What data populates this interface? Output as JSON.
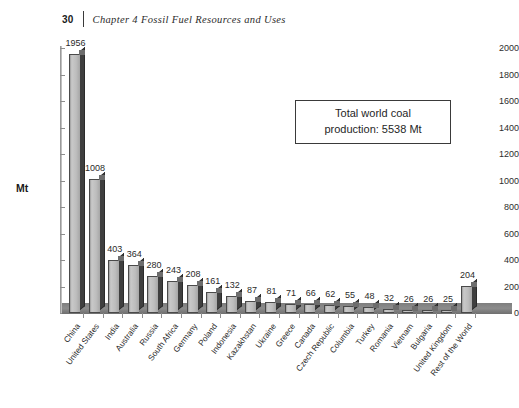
{
  "header": {
    "page_number": "30",
    "title": "Chapter 4  Fossil Fuel Resources and Uses"
  },
  "callout": {
    "line1": "Total world coal",
    "line2": "production: 5538 Mt"
  },
  "chart_data": {
    "type": "bar",
    "title": "",
    "xlabel": "",
    "ylabel": "Mt",
    "ylim": [
      0,
      2000
    ],
    "yticks": [
      0,
      200,
      400,
      600,
      800,
      1000,
      1200,
      1400,
      1600,
      1800,
      2000
    ],
    "grid": false,
    "legend": "none",
    "categories": [
      "China",
      "United States",
      "India",
      "Australia",
      "Russia",
      "South Africa",
      "Germany",
      "Poland",
      "Indonesia",
      "Kazakhstan",
      "Ukraine",
      "Greece",
      "Canada",
      "Czech Republic",
      "Columbia",
      "Turkey",
      "Romania",
      "Vietnam",
      "Bulgaria",
      "United Kingdom",
      "Rest of the World"
    ],
    "values": [
      1956,
      1008,
      403,
      364,
      280,
      243,
      208,
      161,
      132,
      87,
      81,
      71,
      66,
      62,
      55,
      48,
      32,
      26,
      26,
      25,
      204
    ],
    "annotations": [
      "Total world coal production: 5538 Mt"
    ]
  },
  "colors": {
    "bar_face": "#bdbdbd",
    "bar_side": "#3f3f3f",
    "floor": "#8c8c8c",
    "axis": "#8d8d8d",
    "text": "#2a2a2a"
  }
}
